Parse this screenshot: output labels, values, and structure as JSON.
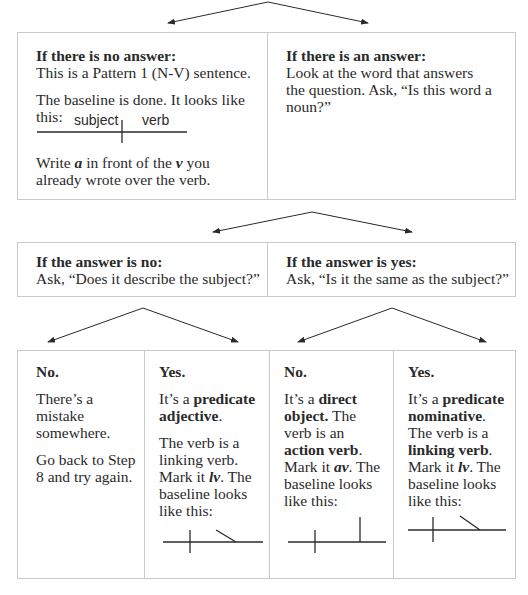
{
  "level1": {
    "no_answer": {
      "heading": "If there is no answer:",
      "line1": "This is a Pattern 1 (N-V) sentence.",
      "line2": "The baseline is done. It looks like this:",
      "diagram_labels": {
        "subject": "subject",
        "verb": "verb"
      },
      "line3_pre": "Write ",
      "line3_a": "a",
      "line3_mid": " in front of the ",
      "line3_v": "v",
      "line3_post": " you already wrote over the verb."
    },
    "answer": {
      "heading": "If there is an answer:",
      "body": "Look at the word that answers the question. Ask, “Is this word a noun?”"
    }
  },
  "level2": {
    "no": {
      "heading": "If the answer is no:",
      "body": "Ask, “Does it describe the subject?”"
    },
    "yes": {
      "heading": "If the answer is yes:",
      "body": "Ask, “Is it the same as the subject?”"
    }
  },
  "level3": {
    "col1": {
      "heading": "No.",
      "p1": "There’s a mistake somewhere.",
      "p2": "Go back to Step 8 and try again."
    },
    "col2": {
      "heading": "Yes.",
      "p1_pre": "It’s a ",
      "p1_bold": "predicate adjective",
      "p1_post": ".",
      "p2_pre": "The verb is a linking verb. Mark it ",
      "p2_mark": "lv",
      "p2_post": ". The baseline looks like this:"
    },
    "col3": {
      "heading": "No.",
      "p1_pre": "It’s a ",
      "p1_bold": "direct object.",
      "p1_mid": " The verb is an ",
      "p1_bold2": "action verb",
      "p1_mid2": ". Mark it ",
      "p1_mark": "av",
      "p1_post": ". The baseline looks like this:"
    },
    "col4": {
      "heading": "Yes.",
      "p1_pre": "It’s a ",
      "p1_bold": "predicate nominative",
      "p1_mid": ". The verb is a ",
      "p1_bold2": "linking verb",
      "p1_mid2": ". Mark it ",
      "p1_mark": "lv",
      "p1_post": ". The baseline looks like this:"
    }
  },
  "colors": {
    "border": "#c9c9c9",
    "ink": "#2a2a2a",
    "background": "#ffffff"
  }
}
